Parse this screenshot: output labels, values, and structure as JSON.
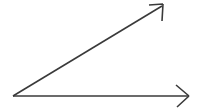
{
  "figure": {
    "title": "Angle formed by two rays",
    "background_color": "#ffffff",
    "stroke_color": "#3a3a3a",
    "width": 198,
    "height": 108
  },
  "chart_data": {
    "type": "diagram",
    "title": "Angle formed by two rays",
    "subtitle": "",
    "xlabel": "",
    "ylabel": "",
    "background_color": "#ffffff",
    "stroke_color": "#3a3a3a",
    "coordinate_space": {
      "width": 198,
      "height": 108,
      "origin": "top-left",
      "y_axis_direction": "down"
    },
    "vertex": {
      "label": "",
      "x": 13,
      "y": 96
    },
    "angle_degrees": 31,
    "rays": [
      {
        "name": "horizontal-ray",
        "label": "",
        "start": {
          "x": 13,
          "y": 96
        },
        "end": {
          "x": 189,
          "y": 96
        },
        "direction_degrees": 0,
        "length": 176,
        "stroke_width": 1.6,
        "stroke_color": "#3a3a3a",
        "arrowhead": {
          "style": "open-v",
          "tip": {
            "x": 189,
            "y": 96
          },
          "barbs": [
            {
              "x": 176,
              "y": 85
            },
            {
              "x": 177,
              "y": 107
            }
          ],
          "stroke_width": 1.6
        }
      },
      {
        "name": "diagonal-ray",
        "label": "",
        "start": {
          "x": 13,
          "y": 96
        },
        "end": {
          "x": 162,
          "y": 6
        },
        "direction_degrees": 31,
        "length": 174,
        "stroke_width": 1.6,
        "stroke_color": "#3a3a3a",
        "arrowhead": {
          "style": "open-v",
          "tip": {
            "x": 163,
            "y": 4
          },
          "barbs": [
            {
              "x": 149,
              "y": 5
            },
            {
              "x": 162,
              "y": 21
            }
          ],
          "stroke_width": 1.6
        }
      }
    ],
    "annotations": [],
    "legend": {
      "visible": false,
      "position": "none",
      "entries": []
    },
    "grid": false,
    "axes_visible": false
  }
}
